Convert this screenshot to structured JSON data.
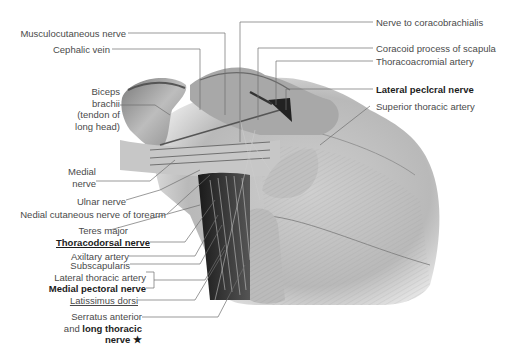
{
  "figure": {
    "labels_left": [
      {
        "id": "musculocutaneous-nerve",
        "text": "Musculocutaneous nerve",
        "style": "normal"
      },
      {
        "id": "cephalic-vein",
        "text": "Cephalic vein",
        "style": "normal"
      },
      {
        "id": "biceps-brachii",
        "lines": [
          "Biceps",
          "brachii",
          "(tendon of",
          "long head)"
        ],
        "style": "normal"
      },
      {
        "id": "medial-nerve",
        "lines": [
          "Medial",
          "nerve"
        ],
        "style": "normal"
      },
      {
        "id": "ulnar-nerve",
        "text": "Ulnar nerve",
        "style": "normal"
      },
      {
        "id": "medial-cutaneous-nerve",
        "text": "Nedial cutaneous nerve of torearm",
        "style": "normal"
      },
      {
        "id": "teres-major",
        "text": "Teres major",
        "style": "normal"
      },
      {
        "id": "thoracodorsal-nerve",
        "text": "Thoracodorsal nerve",
        "style": "bold-underline"
      },
      {
        "id": "axillary-artery",
        "text": "Axiltary artery",
        "style": "normal"
      },
      {
        "id": "subscapularis",
        "text": "Subscapularis",
        "style": "normal"
      },
      {
        "id": "lateral-thoracic-artery",
        "text": "Lateral thoracic artery",
        "style": "normal"
      },
      {
        "id": "medial-pectoral-nerve",
        "text": "Medial pectoral nerve",
        "style": "bold"
      },
      {
        "id": "latissimus-dorsi",
        "text": "Latissimus dorsi",
        "style": "underline"
      },
      {
        "id": "serratus-anterior",
        "lines": [
          "Serratus anterior",
          "and",
          "long thoracic",
          "nerve ★"
        ],
        "style": "mixed"
      }
    ],
    "labels_right": [
      {
        "id": "nerve-to-coracobrachialis",
        "text": "Nerve to coracobrachialis",
        "style": "normal"
      },
      {
        "id": "coracoid-process",
        "text": "Coracoid process of scapula",
        "style": "normal"
      },
      {
        "id": "thoracoacromial-artery",
        "text": "Thoracoacromial artery",
        "style": "normal"
      },
      {
        "id": "lateral-pectoral-nerve",
        "text": "Lateral peclcral nerve",
        "style": "bold"
      },
      {
        "id": "superior-thoracic-artery",
        "text": "Superior thoracic artery",
        "style": "normal"
      }
    ],
    "colors": {
      "leader_line": "#6e6e6e",
      "text": "#4a4a4a",
      "bold_text": "#1c1c1c",
      "muscle_light": "#d2d2d2",
      "muscle_mid": "#9a9a9a",
      "muscle_dark": "#2a2a2a"
    }
  }
}
